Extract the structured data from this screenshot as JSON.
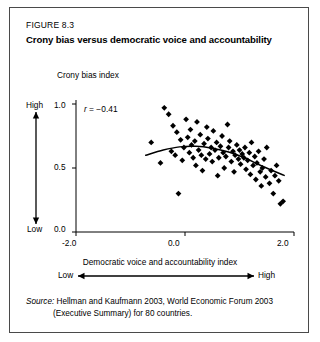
{
  "figure": {
    "number": "FIGURE 8.3",
    "title": "Crony bias versus democratic voice and accountability"
  },
  "source": {
    "label": "Source:",
    "line1": "Hellman and Kaufmann 2003, World Economic Forum 2003",
    "line2": "(Executive Summary) for 80 countries."
  },
  "axes": {
    "y_title": "Crony bias index",
    "y_high": "High",
    "y_low": "Low",
    "y_ticks": [
      "1.0",
      "0.5",
      "0.0"
    ],
    "x_title": "Democratic voice and accountability index",
    "x_low": "Low",
    "x_high": "High",
    "x_ticks": [
      "-2.0",
      "0.0",
      "2.0"
    ]
  },
  "annotation": {
    "r_prefix": "r",
    "r_equals": " = ",
    "r_value": "−0.41"
  },
  "chart_data": {
    "type": "scatter",
    "title": "Crony bias versus democratic voice and accountability",
    "xlabel": "Democratic voice and accountability index",
    "ylabel": "Crony bias index",
    "xlim": [
      -2.0,
      2.0
    ],
    "ylim": [
      0.0,
      1.0
    ],
    "xticks": [
      -2.0,
      0.0,
      2.0
    ],
    "yticks": [
      0.0,
      0.5,
      1.0
    ],
    "grid": false,
    "legend": null,
    "correlation": -0.41,
    "n_points": 80,
    "marker": "diamond",
    "marker_color": "#000000",
    "points": [
      [
        -0.62,
        0.7
      ],
      [
        -0.45,
        0.54
      ],
      [
        -0.38,
        0.97
      ],
      [
        -0.3,
        0.92
      ],
      [
        -0.25,
        0.63
      ],
      [
        -0.22,
        0.83
      ],
      [
        -0.18,
        0.6
      ],
      [
        -0.15,
        0.78
      ],
      [
        -0.12,
        0.3
      ],
      [
        -0.08,
        0.72
      ],
      [
        -0.05,
        0.56
      ],
      [
        -0.02,
        0.66
      ],
      [
        0.02,
        0.88
      ],
      [
        0.05,
        0.74
      ],
      [
        0.08,
        0.62
      ],
      [
        0.1,
        0.8
      ],
      [
        0.12,
        0.68
      ],
      [
        0.15,
        0.58
      ],
      [
        0.18,
        0.71
      ],
      [
        0.2,
        0.52
      ],
      [
        0.22,
        0.86
      ],
      [
        0.25,
        0.64
      ],
      [
        0.28,
        0.76
      ],
      [
        0.3,
        0.6
      ],
      [
        0.32,
        0.48
      ],
      [
        0.35,
        0.69
      ],
      [
        0.38,
        0.57
      ],
      [
        0.4,
        0.82
      ],
      [
        0.42,
        0.73
      ],
      [
        0.45,
        0.61
      ],
      [
        0.48,
        0.66
      ],
      [
        0.5,
        0.55
      ],
      [
        0.52,
        0.79
      ],
      [
        0.55,
        0.64
      ],
      [
        0.58,
        0.7
      ],
      [
        0.6,
        0.44
      ],
      [
        0.62,
        0.58
      ],
      [
        0.65,
        0.67
      ],
      [
        0.68,
        0.75
      ],
      [
        0.7,
        0.62
      ],
      [
        0.72,
        0.5
      ],
      [
        0.75,
        0.59
      ],
      [
        0.78,
        0.84
      ],
      [
        0.8,
        0.66
      ],
      [
        0.82,
        0.71
      ],
      [
        0.85,
        0.55
      ],
      [
        0.88,
        0.63
      ],
      [
        0.9,
        0.47
      ],
      [
        0.92,
        0.6
      ],
      [
        0.95,
        0.68
      ],
      [
        0.98,
        0.57
      ],
      [
        1.0,
        0.64
      ],
      [
        1.02,
        0.53
      ],
      [
        1.05,
        0.61
      ],
      [
        1.08,
        0.58
      ],
      [
        1.1,
        0.66
      ],
      [
        1.12,
        0.49
      ],
      [
        1.15,
        0.56
      ],
      [
        1.18,
        0.62
      ],
      [
        1.2,
        0.45
      ],
      [
        1.22,
        0.7
      ],
      [
        1.25,
        0.52
      ],
      [
        1.28,
        0.59
      ],
      [
        1.3,
        0.41
      ],
      [
        1.32,
        0.54
      ],
      [
        1.35,
        0.63
      ],
      [
        1.38,
        0.47
      ],
      [
        1.4,
        0.36
      ],
      [
        1.42,
        0.5
      ],
      [
        1.45,
        0.57
      ],
      [
        1.48,
        0.43
      ],
      [
        1.5,
        0.66
      ],
      [
        1.55,
        0.38
      ],
      [
        1.58,
        0.48
      ],
      [
        1.62,
        0.3
      ],
      [
        1.65,
        0.44
      ],
      [
        1.68,
        0.52
      ],
      [
        1.72,
        0.4
      ],
      [
        1.75,
        0.22
      ],
      [
        1.8,
        0.24
      ]
    ],
    "trend_line": {
      "type": "quadratic-fit",
      "x_start": -0.72,
      "x_end": 1.82,
      "points": [
        [
          -0.72,
          0.6
        ],
        [
          -0.4,
          0.64
        ],
        [
          -0.1,
          0.665
        ],
        [
          0.2,
          0.67
        ],
        [
          0.5,
          0.655
        ],
        [
          0.8,
          0.625
        ],
        [
          1.1,
          0.578
        ],
        [
          1.4,
          0.518
        ],
        [
          1.82,
          0.442
        ]
      ]
    }
  }
}
